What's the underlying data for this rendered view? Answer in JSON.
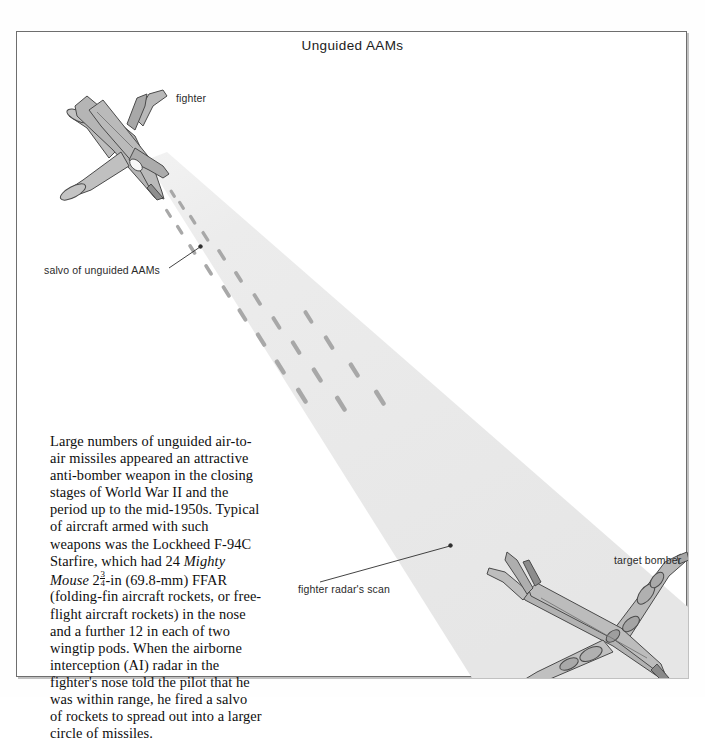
{
  "plate": {
    "title": "Unguided AAMs"
  },
  "labels": {
    "fighter": "fighter",
    "salvo": "salvo of unguided AAMs",
    "radar_scan": "fighter radar's scan",
    "target_bomber": "target bomber"
  },
  "body_text": {
    "full": "Large numbers of unguided air-to-air missiles appeared an attractive anti-bomber weapon in the closing stages of World War II and the period up to the mid-1950s. Typical of aircraft armed with such weapons was the Lockheed F-94C Starfire, which had 24 Mighty Mouse 2 3/4-in (69.8-mm) FFAR (folding-fin aircraft rockets, or free-flight aircraft rockets) in the nose and a further 12 in each of two wingtip pods. When the airborne interception (AI) radar in the fighter's nose told the pilot that he was within range, he fired a salvo of rockets to spread out into a larger circle of missiles.",
    "seg1": "Large numbers of unguided air-to-air missiles appeared an attractive anti-bomber weapon in the closing stages of World War II and the period up to the mid-1950s. Typical of aircraft armed with such weapons was the Lockheed F-94C Starfire, which had 24 ",
    "italic1": "Mighty Mouse",
    "seg2": "-in (69.8-mm) FFAR (folding-fin aircraft rockets, or free-flight aircraft rockets) in the nose and a further 12 in each of two wingtip pods. When the airborne interception (AI) radar in the fighter's nose told the pilot that he was within range, he fired a salvo of rockets to spread out into a larger circle of missiles.",
    "fraction_whole": "2",
    "fraction_num": "3",
    "fraction_den": "4"
  },
  "colors": {
    "frame": "#6e6e6e",
    "page": "#ffffff",
    "radar_cone": "#e8e8e8",
    "aircraft_fill": "#b5b5b5",
    "aircraft_fill_light": "#c8c8c8",
    "aircraft_fill_dark": "#9a9a9a",
    "aircraft_outline": "#4a4a4a",
    "rocket": "#a6a6a6",
    "text": "#0e0e0e",
    "leader_line": "#3a3a3a"
  },
  "scene": {
    "radar_cone_apex": [
      145,
      135
    ],
    "radar_cone_left_base": [
      455,
      646
    ],
    "radar_cone_right_base": [
      671,
      600
    ],
    "fighter_position": [
      95,
      110
    ],
    "bomber_position": [
      590,
      600
    ],
    "rocket_count": 24,
    "leader_lines": [
      {
        "name": "salvo-leader",
        "from": [
          152,
          235
        ],
        "to": [
          182,
          216
        ]
      },
      {
        "name": "radar-leader",
        "from": [
          302,
          549
        ],
        "to": [
          432,
          515
        ]
      }
    ]
  }
}
